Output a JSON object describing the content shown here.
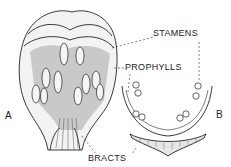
{
  "figure": {
    "labels": {
      "stamens": "STAMENS",
      "prophylls": "PROPHYLLS",
      "bracts": "BRACTS",
      "panel_a": "A",
      "panel_b": "B"
    },
    "colors": {
      "ink": "#222222",
      "shade": "#9a9a9a",
      "background": "#ffffff"
    }
  }
}
